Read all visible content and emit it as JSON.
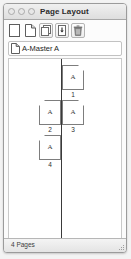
{
  "window": {
    "title": "Page Layout",
    "traffic_lights": [
      "close-button",
      "minimize-button",
      "zoom-button"
    ]
  },
  "toolbar": {
    "items": [
      {
        "name": "new-page-icon",
        "label": "New Page",
        "framed": false
      },
      {
        "name": "new-master-page-icon",
        "label": "New Master Page",
        "framed": false
      },
      {
        "name": "duplicate-pages-icon",
        "label": "Duplicate Pages",
        "framed": true
      },
      {
        "name": "insert-pages-icon",
        "label": "Insert Pages",
        "framed": true
      },
      {
        "name": "delete-pages-icon",
        "label": "Delete Pages",
        "framed": true
      }
    ]
  },
  "master": {
    "icon": "master-page-icon",
    "label": "A-Master A"
  },
  "layout": {
    "spread_line": "spine-divider",
    "spreads": [
      {
        "pages": [
          {
            "number": "1",
            "master": "A",
            "side": "right"
          }
        ]
      },
      {
        "pages": [
          {
            "number": "2",
            "master": "A",
            "side": "left"
          },
          {
            "number": "3",
            "master": "A",
            "side": "right"
          }
        ]
      },
      {
        "pages": [
          {
            "number": "4",
            "master": "A",
            "side": "left"
          }
        ]
      }
    ]
  },
  "status": {
    "page_count_label": "4 Pages"
  },
  "colors": {
    "frame_border": "#9b9b9b",
    "page_outline": "#7d7d7d",
    "spine": "#3a3a3a",
    "panel_bg": "#fbfbfb",
    "canvas_bg": "#ffffff"
  }
}
